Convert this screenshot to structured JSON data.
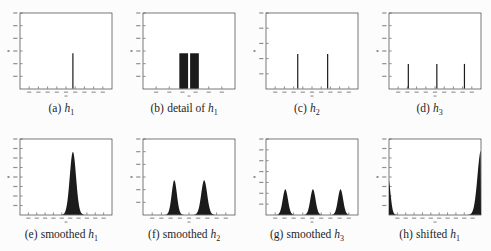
{
  "figure": {
    "background": "#fcfcfc",
    "plot_background": "#ffffff",
    "ink": "#1b1b1b",
    "frame_color": "#3f3f3f",
    "tick_smudge_color": "#8f8f8f",
    "caption_color": "#1e1e1e",
    "tick_labels_legible": false
  },
  "chart_data": [
    {
      "id": "a",
      "type": "bar",
      "subtype": "impulse-histogram",
      "caption": {
        "tag": "(a)",
        "pre": "",
        "var": "h",
        "sub": "1"
      },
      "impulses": [
        {
          "x_frac": 0.575,
          "height_frac": 0.47
        }
      ],
      "x_tick_count": 9,
      "y_tick_count": 6
    },
    {
      "id": "b",
      "type": "bar",
      "subtype": "zoomed-bars",
      "caption": {
        "tag": "(b)",
        "pre": "detail of ",
        "var": "h",
        "sub": "1"
      },
      "bars": [
        {
          "x0_frac": 0.395,
          "x1_frac": 0.49,
          "height_frac": 0.47
        },
        {
          "x0_frac": 0.512,
          "x1_frac": 0.607,
          "height_frac": 0.47
        }
      ],
      "x_tick_count": 6,
      "y_tick_count": 6
    },
    {
      "id": "c",
      "type": "bar",
      "subtype": "impulse-histogram",
      "caption": {
        "tag": "(c)",
        "pre": "",
        "var": "h",
        "sub": "2"
      },
      "impulses": [
        {
          "x_frac": 0.345,
          "height_frac": 0.46
        },
        {
          "x_frac": 0.67,
          "height_frac": 0.46
        }
      ],
      "x_tick_count": 9,
      "y_tick_count": 5
    },
    {
      "id": "d",
      "type": "bar",
      "subtype": "impulse-histogram",
      "caption": {
        "tag": "(d)",
        "pre": "",
        "var": "h",
        "sub": "3"
      },
      "impulses": [
        {
          "x_frac": 0.21,
          "height_frac": 0.33
        },
        {
          "x_frac": 0.52,
          "height_frac": 0.33
        },
        {
          "x_frac": 0.82,
          "height_frac": 0.33
        }
      ],
      "x_tick_count": 9,
      "y_tick_count": 6
    },
    {
      "id": "e",
      "type": "area",
      "subtype": "smoothed-histogram",
      "caption": {
        "tag": "(e)",
        "pre": "smoothed ",
        "var": "h",
        "sub": "1"
      },
      "peaks": [
        {
          "center_frac": 0.575,
          "height_frac": 0.84,
          "sigma_frac": 0.034
        }
      ],
      "x_tick_count": 10,
      "y_tick_count": 8
    },
    {
      "id": "f",
      "type": "area",
      "subtype": "smoothed-histogram",
      "caption": {
        "tag": "(f)",
        "pre": "smoothed ",
        "var": "h",
        "sub": "2"
      },
      "peaks": [
        {
          "center_frac": 0.34,
          "height_frac": 0.46,
          "sigma_frac": 0.028
        },
        {
          "center_frac": 0.665,
          "height_frac": 0.46,
          "sigma_frac": 0.032
        }
      ],
      "x_tick_count": 9,
      "y_tick_count": 6
    },
    {
      "id": "g",
      "type": "area",
      "subtype": "smoothed-histogram",
      "caption": {
        "tag": "(g)",
        "pre": "smoothed ",
        "var": "h",
        "sub": "3"
      },
      "peaks": [
        {
          "center_frac": 0.21,
          "height_frac": 0.34,
          "sigma_frac": 0.028
        },
        {
          "center_frac": 0.51,
          "height_frac": 0.34,
          "sigma_frac": 0.028
        },
        {
          "center_frac": 0.81,
          "height_frac": 0.34,
          "sigma_frac": 0.028
        }
      ],
      "x_tick_count": 9,
      "y_tick_count": 7
    },
    {
      "id": "h",
      "type": "area",
      "subtype": "shifted-histogram-wraparound",
      "caption": {
        "tag": "(h)",
        "pre": "shifted ",
        "var": "h",
        "sub": "1"
      },
      "peaks": [
        {
          "center_frac": 1.0,
          "height_frac": 0.86,
          "sigma_frac": 0.038
        },
        {
          "center_frac": -0.01,
          "height_frac": 0.5,
          "sigma_frac": 0.025
        }
      ],
      "x_tick_count": 10,
      "y_tick_count": 8
    }
  ]
}
